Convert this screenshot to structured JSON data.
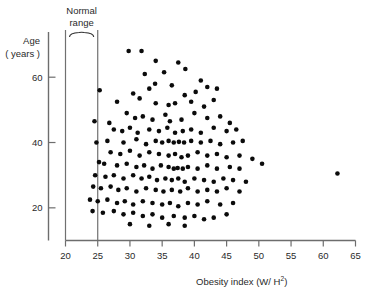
{
  "chart_data": {
    "type": "scatter",
    "title": "",
    "xlabel": "Obesity index (W/H²)",
    "xlabel_base": "Obesity index (W/ H",
    "xlabel_sup": "2",
    "xlabel_tail": ")",
    "ylabel_line1": "Age",
    "ylabel_line2": "( years )",
    "ylabel": "Age (years)",
    "xlim": [
      20,
      65
    ],
    "ylim": [
      10,
      72
    ],
    "xticks": [
      20,
      25,
      30,
      35,
      40,
      45,
      50,
      55,
      60,
      65
    ],
    "xtick_labels": [
      "20",
      "25",
      "30",
      "35",
      "40",
      "45",
      "50",
      "55",
      "60",
      "65"
    ],
    "yticks": [
      20,
      40,
      60
    ],
    "ytick_labels": [
      "20",
      "40",
      "60"
    ],
    "grid": false,
    "legend": null,
    "marker": "filled-circle",
    "marker_color": "#0b0b0b",
    "marker_size_px": 4.6,
    "annotations": [
      {
        "name": "normal-range",
        "text_line1": "Normal",
        "text_line2": "range",
        "text": "Normal range",
        "x_from": 20,
        "x_to": 25,
        "style": "brace-above-with-two-vertical-lines"
      }
    ],
    "axis_color": "#6d6d6d",
    "points": [
      [
        29.8,
        68.0
      ],
      [
        31.8,
        68.0
      ],
      [
        34.0,
        65.0
      ],
      [
        37.5,
        64.5
      ],
      [
        38.6,
        62.5
      ],
      [
        32.3,
        61.0
      ],
      [
        35.3,
        61.5
      ],
      [
        25.3,
        56.0
      ],
      [
        33.9,
        58.0
      ],
      [
        36.5,
        57.5
      ],
      [
        41.0,
        59.0
      ],
      [
        30.5,
        55.0
      ],
      [
        33.0,
        56.5
      ],
      [
        38.5,
        54.5
      ],
      [
        40.2,
        55.5
      ],
      [
        42.0,
        57.0
      ],
      [
        43.5,
        56.5
      ],
      [
        28.0,
        52.5
      ],
      [
        31.5,
        53.5
      ],
      [
        34.0,
        52.0
      ],
      [
        36.0,
        51.5
      ],
      [
        37.0,
        52.0
      ],
      [
        39.5,
        52.5
      ],
      [
        41.5,
        51.0
      ],
      [
        43.0,
        53.0
      ],
      [
        26.8,
        46.0
      ],
      [
        24.5,
        46.5
      ],
      [
        29.5,
        49.0
      ],
      [
        30.8,
        47.5
      ],
      [
        32.0,
        48.0
      ],
      [
        33.5,
        47.0
      ],
      [
        35.5,
        48.5
      ],
      [
        36.2,
        46.5
      ],
      [
        38.0,
        47.0
      ],
      [
        40.0,
        49.0
      ],
      [
        42.0,
        47.5
      ],
      [
        44.0,
        48.0
      ],
      [
        45.5,
        46.0
      ],
      [
        27.5,
        44.0
      ],
      [
        28.8,
        43.5
      ],
      [
        30.0,
        44.5
      ],
      [
        31.2,
        43.0
      ],
      [
        33.0,
        44.0
      ],
      [
        34.5,
        43.5
      ],
      [
        35.8,
        44.5
      ],
      [
        37.0,
        43.0
      ],
      [
        38.2,
        43.5
      ],
      [
        39.5,
        44.0
      ],
      [
        41.0,
        43.0
      ],
      [
        43.0,
        44.5
      ],
      [
        45.0,
        43.5
      ],
      [
        46.5,
        44.0
      ],
      [
        24.8,
        40.0
      ],
      [
        26.5,
        40.5
      ],
      [
        29.0,
        40.0
      ],
      [
        31.0,
        41.0
      ],
      [
        32.5,
        39.5
      ],
      [
        34.0,
        40.5
      ],
      [
        35.0,
        40.0
      ],
      [
        36.0,
        40.5
      ],
      [
        36.8,
        40.0
      ],
      [
        37.6,
        40.2
      ],
      [
        38.4,
        40.0
      ],
      [
        39.5,
        40.5
      ],
      [
        41.0,
        40.0
      ],
      [
        42.5,
        40.5
      ],
      [
        44.0,
        39.5
      ],
      [
        46.0,
        40.0
      ],
      [
        47.5,
        40.5
      ],
      [
        27.0,
        37.0
      ],
      [
        28.5,
        36.5
      ],
      [
        30.0,
        37.5
      ],
      [
        31.5,
        36.0
      ],
      [
        33.0,
        37.0
      ],
      [
        34.5,
        36.5
      ],
      [
        36.0,
        36.0
      ],
      [
        37.0,
        36.5
      ],
      [
        38.0,
        35.5
      ],
      [
        39.0,
        36.0
      ],
      [
        40.5,
        37.0
      ],
      [
        42.0,
        36.0
      ],
      [
        43.5,
        36.5
      ],
      [
        45.0,
        35.5
      ],
      [
        47.0,
        36.0
      ],
      [
        49.0,
        35.0
      ],
      [
        25.2,
        34.0
      ],
      [
        26.0,
        33.5
      ],
      [
        28.0,
        33.0
      ],
      [
        29.5,
        33.5
      ],
      [
        31.0,
        32.5
      ],
      [
        32.2,
        33.0
      ],
      [
        33.5,
        32.0
      ],
      [
        34.8,
        33.0
      ],
      [
        36.0,
        32.5
      ],
      [
        36.8,
        32.0
      ],
      [
        37.4,
        32.2
      ],
      [
        38.2,
        32.0
      ],
      [
        39.0,
        32.5
      ],
      [
        40.5,
        32.0
      ],
      [
        42.0,
        33.0
      ],
      [
        43.5,
        32.0
      ],
      [
        45.5,
        32.5
      ],
      [
        47.0,
        32.0
      ],
      [
        50.5,
        33.5
      ],
      [
        62.2,
        30.5
      ],
      [
        24.6,
        30.0
      ],
      [
        26.2,
        29.5
      ],
      [
        27.5,
        30.0
      ],
      [
        29.0,
        29.0
      ],
      [
        30.5,
        30.0
      ],
      [
        31.8,
        29.0
      ],
      [
        33.0,
        29.5
      ],
      [
        34.2,
        28.5
      ],
      [
        35.5,
        29.0
      ],
      [
        36.5,
        28.5
      ],
      [
        37.5,
        29.0
      ],
      [
        38.5,
        28.0
      ],
      [
        40.0,
        29.0
      ],
      [
        41.5,
        28.5
      ],
      [
        43.0,
        28.0
      ],
      [
        44.5,
        29.0
      ],
      [
        46.0,
        28.5
      ],
      [
        48.0,
        28.0
      ],
      [
        24.3,
        26.5
      ],
      [
        25.5,
        26.0
      ],
      [
        27.0,
        26.5
      ],
      [
        28.2,
        25.5
      ],
      [
        29.5,
        26.0
      ],
      [
        31.0,
        25.0
      ],
      [
        32.5,
        26.0
      ],
      [
        34.0,
        25.5
      ],
      [
        35.2,
        25.0
      ],
      [
        36.5,
        25.5
      ],
      [
        37.8,
        25.0
      ],
      [
        39.0,
        26.0
      ],
      [
        40.5,
        25.0
      ],
      [
        42.0,
        25.5
      ],
      [
        43.5,
        25.0
      ],
      [
        45.0,
        26.0
      ],
      [
        47.0,
        25.0
      ],
      [
        23.8,
        22.5
      ],
      [
        25.0,
        22.0
      ],
      [
        26.5,
        22.5
      ],
      [
        28.0,
        21.5
      ],
      [
        29.2,
        22.0
      ],
      [
        30.5,
        21.0
      ],
      [
        32.0,
        22.0
      ],
      [
        33.5,
        21.5
      ],
      [
        35.0,
        21.0
      ],
      [
        36.2,
        21.5
      ],
      [
        37.5,
        20.5
      ],
      [
        39.0,
        21.5
      ],
      [
        40.5,
        21.0
      ],
      [
        42.0,
        22.0
      ],
      [
        44.0,
        21.0
      ],
      [
        46.0,
        21.5
      ],
      [
        24.2,
        19.0
      ],
      [
        25.8,
        18.5
      ],
      [
        27.5,
        19.0
      ],
      [
        29.0,
        18.0
      ],
      [
        30.5,
        18.5
      ],
      [
        32.0,
        17.5
      ],
      [
        33.5,
        18.0
      ],
      [
        35.0,
        17.0
      ],
      [
        36.8,
        17.5
      ],
      [
        38.5,
        17.0
      ],
      [
        40.0,
        17.5
      ],
      [
        41.5,
        16.5
      ],
      [
        43.0,
        17.0
      ],
      [
        45.0,
        18.0
      ],
      [
        30.0,
        15.0
      ],
      [
        33.0,
        14.5
      ],
      [
        36.0,
        15.0
      ],
      [
        38.5,
        14.5
      ]
    ]
  }
}
